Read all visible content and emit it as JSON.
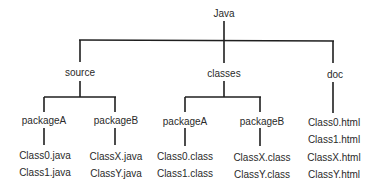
{
  "root": {
    "label": "Java"
  },
  "level1": [
    {
      "label": "source"
    },
    {
      "label": "classes"
    },
    {
      "label": "doc"
    }
  ],
  "source": {
    "packages": [
      {
        "label": "packageA",
        "files": [
          "Class0.java",
          "Class1.java"
        ]
      },
      {
        "label": "packageB",
        "files": [
          "ClassX.java",
          "ClassY.java"
        ]
      }
    ]
  },
  "classes": {
    "packages": [
      {
        "label": "packageA",
        "files": [
          "Class0.class",
          "Class1.class"
        ]
      },
      {
        "label": "packageB",
        "files": [
          "ClassX.class",
          "ClassY.class"
        ]
      }
    ]
  },
  "doc": {
    "files": [
      "Class0.html",
      "Class1.html",
      "ClassX.html",
      "ClassY.html"
    ]
  }
}
